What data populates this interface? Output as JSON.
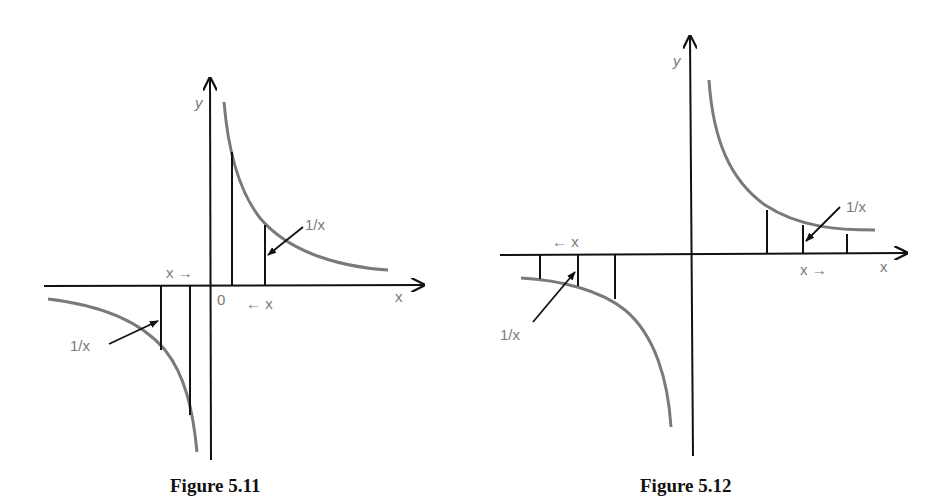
{
  "figures": [
    {
      "caption": "Figure 5.11",
      "labels": {
        "y_axis": "y",
        "x_axis": "x",
        "origin": "0",
        "upper_curve": "1/x",
        "lower_curve": "1/x",
        "x_right_arrow": "x →",
        "x_left_arrow": "← x"
      }
    },
    {
      "caption": "Figure 5.12",
      "labels": {
        "y_axis": "y",
        "x_axis": "x",
        "upper_curve": "1/x",
        "lower_curve": "1/x",
        "x_right_arrow": "x →",
        "x_left_arrow": "← x"
      }
    }
  ],
  "colors": {
    "axis": "#111111",
    "curve": "#7a7a7a",
    "label": "#7a7a7a"
  }
}
